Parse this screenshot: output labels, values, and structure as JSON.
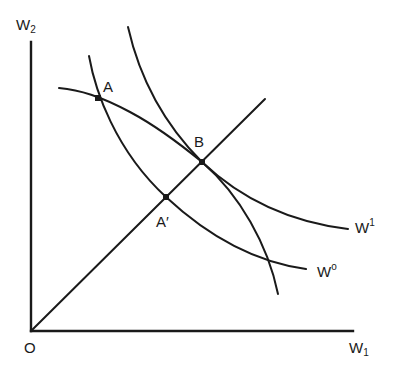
{
  "diagram": {
    "type": "welfare-frontier",
    "axes": {
      "x": {
        "label": "W",
        "subscript": "1"
      },
      "y": {
        "label": "W",
        "subscript": "2"
      },
      "origin_label": "O"
    },
    "curves": [
      {
        "id": "W0",
        "label": "W",
        "superscript": "o",
        "kind": "indifference",
        "passes_through": [
          "A",
          "A'"
        ]
      },
      {
        "id": "W1",
        "label": "W",
        "superscript": "1",
        "kind": "indifference",
        "passes_through": [
          "B"
        ]
      },
      {
        "id": "frontier",
        "label": "",
        "kind": "possibility-frontier",
        "passes_through": [
          "A",
          "B"
        ]
      }
    ],
    "ray": {
      "from": "O",
      "passes_through": [
        "A'",
        "B"
      ]
    },
    "points": [
      {
        "id": "A",
        "label": "A"
      },
      {
        "id": "A_prime",
        "label": "A′"
      },
      {
        "id": "B",
        "label": "B"
      }
    ]
  }
}
